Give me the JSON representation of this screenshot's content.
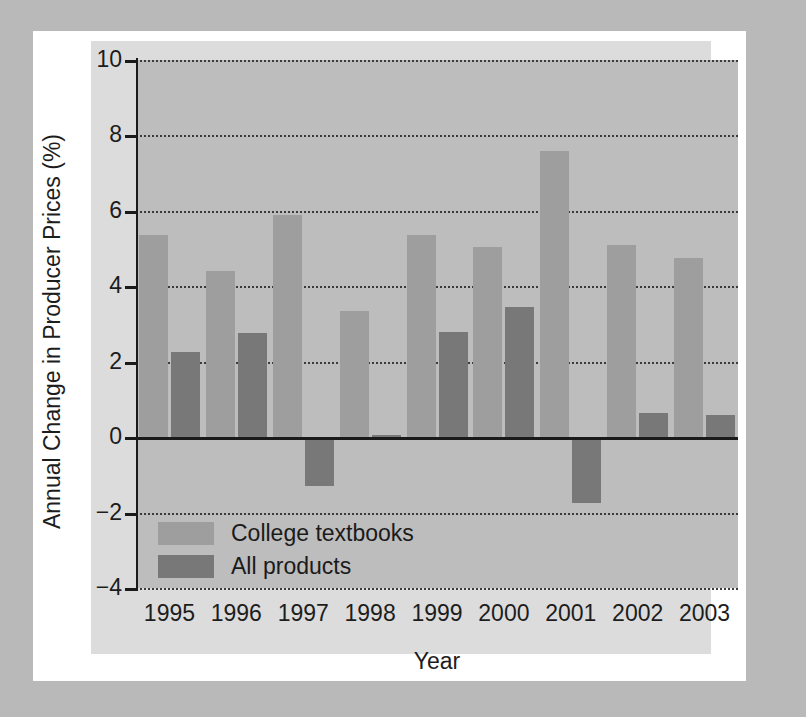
{
  "chart_data": {
    "type": "bar",
    "title": "",
    "xlabel": "Year",
    "ylabel": "Annual Change in Producer Prices (%)",
    "categories": [
      "1995",
      "1996",
      "1997",
      "1998",
      "1999",
      "2000",
      "2001",
      "2002",
      "2003"
    ],
    "series": [
      {
        "name": "College textbooks",
        "color": "#9e9e9e",
        "values": [
          5.35,
          4.4,
          5.9,
          3.35,
          5.35,
          5.05,
          7.6,
          5.1,
          4.75
        ]
      },
      {
        "name": "All products",
        "color": "#787878",
        "values": [
          2.25,
          2.75,
          -1.3,
          0.05,
          2.8,
          3.45,
          -1.75,
          0.65,
          0.6
        ]
      }
    ],
    "ylim": [
      -4,
      10
    ],
    "ytick_labels": [
      "10",
      "8",
      "6",
      "4",
      "2",
      "0",
      "-2",
      "-4"
    ],
    "yticks": [
      10,
      8,
      6,
      4,
      2,
      0,
      -2,
      -4
    ],
    "grid": true,
    "gridstyle": "dotted-horizontal",
    "zero_line": true,
    "legend_position": "lower-left-inside",
    "plot_background": "#bdbdbd",
    "panel_background": "#dcdcdc",
    "figure_background": "#ffffff",
    "page_background": "#b9b9b9"
  }
}
